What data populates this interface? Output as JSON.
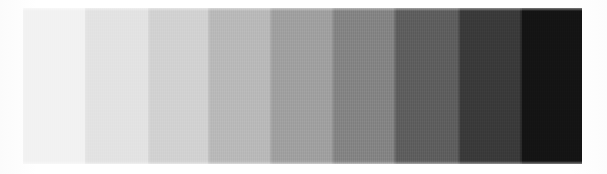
{
  "document": {
    "title": "Grayscale Step Wedge",
    "background_color": "#ffffff"
  },
  "chart_data": {
    "type": "bar",
    "subtitle": "",
    "xlabel": "",
    "ylabel": "",
    "orientation": "horizontal-strip",
    "grid": false,
    "legend": null,
    "axis_visible": false,
    "tick_labels_visible": false,
    "categories": [
      "Step 1",
      "Step 2",
      "Step 3",
      "Step 4",
      "Step 5",
      "Step 6",
      "Step 7",
      "Step 8",
      "Step 9"
    ],
    "values": [
      242,
      227,
      210,
      185,
      160,
      132,
      94,
      58,
      20
    ],
    "value_unit": "8-bit gray level (0=black, 255=white)",
    "colors": [
      "#f2f2f2",
      "#e3e3e3",
      "#d2d2d2",
      "#b9b9b9",
      "#a0a0a0",
      "#848484",
      "#5e5e5e",
      "#3a3a3a",
      "#141414"
    ],
    "patch_widths_px": [
      62,
      63,
      60,
      62,
      62,
      62,
      64,
      62,
      62
    ],
    "ylim": [
      0,
      255
    ]
  },
  "wedge": {
    "label": "grayscale-step-wedge",
    "step_count": 9,
    "bounds": {
      "left": 23,
      "top": 8,
      "width": 559,
      "height": 156
    },
    "patches": [
      {
        "index": 1,
        "name": "patch-1",
        "color": "#f2f2f2",
        "gray_level": 242,
        "width": 62
      },
      {
        "index": 2,
        "name": "patch-2",
        "color": "#e3e3e3",
        "gray_level": 227,
        "width": 63
      },
      {
        "index": 3,
        "name": "patch-3",
        "color": "#d2d2d2",
        "gray_level": 210,
        "width": 60
      },
      {
        "index": 4,
        "name": "patch-4",
        "color": "#b9b9b9",
        "gray_level": 185,
        "width": 62
      },
      {
        "index": 5,
        "name": "patch-5",
        "color": "#a0a0a0",
        "gray_level": 160,
        "width": 62
      },
      {
        "index": 6,
        "name": "patch-6",
        "color": "#848484",
        "gray_level": 132,
        "width": 62
      },
      {
        "index": 7,
        "name": "patch-7",
        "color": "#5e5e5e",
        "gray_level": 94,
        "width": 64
      },
      {
        "index": 8,
        "name": "patch-8",
        "color": "#3a3a3a",
        "gray_level": 58,
        "width": 62
      },
      {
        "index": 9,
        "name": "patch-9",
        "color": "#141414",
        "gray_level": 20,
        "width": 62
      }
    ]
  }
}
